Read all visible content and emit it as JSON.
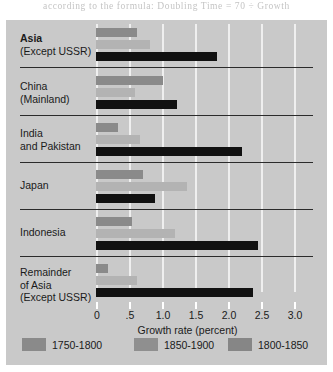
{
  "scan_text": "according to the formula: Doubling Time = 70 ÷ Growth",
  "chart_data": {
    "type": "bar",
    "orientation": "horizontal",
    "title": "",
    "xlabel": "Growth rate (percent)",
    "ylabel": "",
    "xlim": [
      0,
      3.0
    ],
    "xticks": [
      "0",
      ".5",
      "1.0",
      "1.5",
      "2.0",
      "2.5",
      "3.0"
    ],
    "xtick_values": [
      0,
      0.5,
      1.0,
      1.5,
      2.0,
      2.5,
      3.0
    ],
    "grid": true,
    "legend_position": "bottom",
    "categories": [
      "Asia (Except USSR)",
      "China (Mainland)",
      "India and Pakistan",
      "Japan",
      "Indonesia",
      "Remainder of Asia (Except USSR)"
    ],
    "series": [
      {
        "name": "1750-1800",
        "color": "#8a8a8a",
        "values": [
          0.62,
          1.02,
          0.33,
          0.71,
          0.55,
          0.18
        ]
      },
      {
        "name": "1850-1900",
        "color": "#b3b3b3",
        "values": [
          0.82,
          0.59,
          0.67,
          1.38,
          1.2,
          0.62
        ]
      },
      {
        "name": "1800-1850",
        "color": "#111111",
        "values": [
          1.83,
          1.23,
          2.21,
          0.89,
          2.45,
          2.38
        ]
      }
    ]
  },
  "groups": [
    {
      "lines": [
        "Asia",
        "(Except USSR)"
      ],
      "bold_first": true
    },
    {
      "lines": [
        "China",
        "(Mainland)"
      ],
      "bold_first": false
    },
    {
      "lines": [
        "India",
        "and Pakistan"
      ],
      "bold_first": false
    },
    {
      "lines": [
        "Japan"
      ],
      "bold_first": false
    },
    {
      "lines": [
        "Indonesia"
      ],
      "bold_first": false
    },
    {
      "lines": [
        "Remainder",
        "of Asia",
        "(Except USSR)"
      ],
      "bold_first": false
    }
  ],
  "legend": [
    {
      "label": "1750-1800",
      "swatch": "legend-swatch-1750-1800"
    },
    {
      "label": "1850-1900",
      "swatch": "legend-swatch-1850-1900"
    },
    {
      "label": "1800-1850",
      "swatch": "legend-swatch-1800-1850"
    }
  ]
}
